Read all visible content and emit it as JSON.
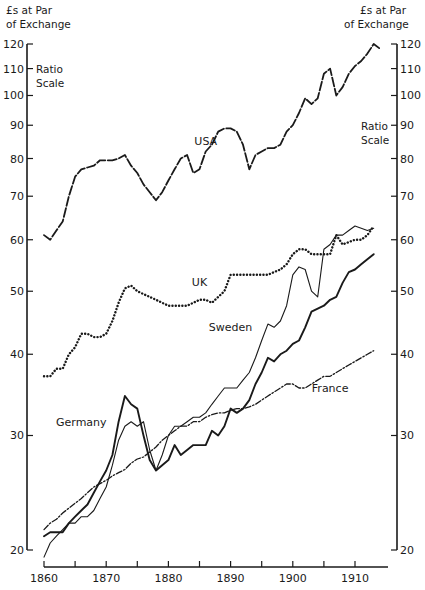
{
  "chart_data": {
    "type": "line",
    "title": "",
    "y_axis_title": [
      "£s at Par",
      "of Exchange"
    ],
    "scale_note": [
      "Ratio",
      "Scale"
    ],
    "xlabel": "",
    "ylabel": "£s at Par of Exchange",
    "y_scale": "log",
    "ylim": [
      20,
      120
    ],
    "xlim": [
      1860,
      1915
    ],
    "grid": false,
    "x_ticks": [
      1860,
      1865,
      1870,
      1875,
      1880,
      1885,
      1890,
      1895,
      1900,
      1905,
      1910
    ],
    "x_tick_labels": [
      "1860",
      "1870",
      "1880",
      "1890",
      "1900",
      "1910"
    ],
    "y_ticks": [
      20,
      30,
      40,
      50,
      60,
      70,
      80,
      90,
      100,
      110,
      120
    ],
    "y_tick_labels": [
      "20",
      "30",
      "40",
      "50",
      "60",
      "70",
      "80",
      "90",
      "100",
      "110",
      "120"
    ],
    "series": [
      {
        "name": "USA",
        "style": "long-dash",
        "label_at": [
          1886,
          84
        ],
        "x": [
          1860,
          1861,
          1862,
          1863,
          1864,
          1865,
          1866,
          1867,
          1868,
          1869,
          1870,
          1871,
          1872,
          1873,
          1874,
          1875,
          1876,
          1877,
          1878,
          1879,
          1880,
          1881,
          1882,
          1883,
          1884,
          1885,
          1886,
          1887,
          1888,
          1889,
          1890,
          1891,
          1892,
          1893,
          1894,
          1895,
          1896,
          1897,
          1898,
          1899,
          1900,
          1901,
          1902,
          1903,
          1904,
          1905,
          1906,
          1907,
          1908,
          1909,
          1910,
          1911,
          1912,
          1913,
          1914
        ],
        "values": [
          61,
          60,
          62,
          64,
          70,
          75,
          77,
          77.5,
          78,
          79.5,
          79.5,
          79.5,
          80,
          81,
          78,
          76,
          73,
          71,
          69,
          71,
          74,
          77,
          80,
          81,
          76,
          77,
          82,
          84,
          88,
          89,
          89,
          88,
          84,
          77,
          81,
          82,
          83,
          83,
          84,
          88,
          90,
          94,
          99,
          97,
          99,
          108,
          110,
          100,
          103,
          108,
          111,
          113,
          116,
          120,
          118
        ]
      },
      {
        "name": "UK",
        "style": "dotted",
        "label_at": [
          1885,
          51
        ],
        "x": [
          1860,
          1861,
          1862,
          1863,
          1864,
          1865,
          1866,
          1867,
          1868,
          1869,
          1870,
          1871,
          1872,
          1873,
          1874,
          1875,
          1876,
          1877,
          1878,
          1879,
          1880,
          1881,
          1882,
          1883,
          1884,
          1885,
          1886,
          1887,
          1888,
          1889,
          1890,
          1891,
          1892,
          1893,
          1894,
          1895,
          1896,
          1897,
          1898,
          1899,
          1900,
          1901,
          1902,
          1903,
          1904,
          1905,
          1906,
          1907,
          1908,
          1909,
          1910,
          1911,
          1912,
          1913
        ],
        "values": [
          37,
          37,
          38,
          38,
          40,
          41,
          43,
          43,
          42.5,
          42.5,
          43,
          45,
          48,
          50.5,
          51,
          50,
          49.5,
          49,
          48.5,
          48,
          47.5,
          47.5,
          47.5,
          47.5,
          48,
          48.5,
          48.5,
          48,
          49,
          50,
          53,
          53,
          53,
          53,
          53,
          53,
          53,
          53.5,
          54,
          55,
          57,
          58,
          58,
          57,
          57,
          57,
          57,
          61,
          59,
          59.5,
          60,
          60,
          61,
          63
        ]
      },
      {
        "name": "Germany",
        "style": "solid-heavy",
        "label_at": [
          1866,
          31
        ],
        "x": [
          1860,
          1861,
          1862,
          1863,
          1864,
          1865,
          1866,
          1867,
          1868,
          1869,
          1870,
          1871,
          1872,
          1873,
          1874,
          1875,
          1876,
          1877,
          1878,
          1879,
          1880,
          1881,
          1882,
          1883,
          1884,
          1885,
          1886,
          1887,
          1888,
          1889,
          1890,
          1891,
          1892,
          1893,
          1894,
          1895,
          1896,
          1897,
          1898,
          1899,
          1900,
          1901,
          1902,
          1903,
          1904,
          1905,
          1906,
          1907,
          1908,
          1909,
          1910,
          1911,
          1912,
          1913
        ],
        "values": [
          21,
          21.3,
          21.3,
          21.3,
          22,
          22.5,
          23,
          23.5,
          24.5,
          25.5,
          26.5,
          28,
          31.5,
          34.5,
          33.5,
          33,
          30,
          27.5,
          26.5,
          27,
          27.5,
          29,
          28,
          28.5,
          29,
          29,
          29,
          30.5,
          30,
          31,
          33,
          32.5,
          33,
          34,
          36,
          37.5,
          39.5,
          39,
          40,
          40.5,
          41.5,
          42,
          44,
          46.5,
          47,
          47.5,
          48.5,
          49,
          51.5,
          53.5,
          54,
          55,
          56,
          57
        ]
      },
      {
        "name": "Sweden",
        "style": "solid-light",
        "label_at": [
          1890,
          43.5
        ],
        "x": [
          1860,
          1861,
          1862,
          1863,
          1864,
          1865,
          1866,
          1867,
          1868,
          1869,
          1870,
          1871,
          1872,
          1873,
          1874,
          1875,
          1876,
          1877,
          1878,
          1879,
          1880,
          1881,
          1882,
          1883,
          1884,
          1885,
          1886,
          1887,
          1888,
          1889,
          1890,
          1891,
          1892,
          1893,
          1894,
          1895,
          1896,
          1897,
          1898,
          1899,
          1900,
          1901,
          1902,
          1903,
          1904,
          1905,
          1906,
          1907,
          1908,
          1909,
          1910,
          1911,
          1912,
          1913
        ],
        "values": [
          19.5,
          20.5,
          21,
          21.5,
          22,
          22,
          22.5,
          22.5,
          23,
          24,
          25,
          27,
          29.5,
          31,
          31.5,
          31,
          31.5,
          28.5,
          26.5,
          28,
          30,
          31,
          31,
          31.5,
          32,
          32,
          32.5,
          33.5,
          34.5,
          35.5,
          35.5,
          35.5,
          36.5,
          37.5,
          39.5,
          42,
          44.5,
          44,
          45,
          47.5,
          53,
          54.5,
          54,
          50,
          49,
          58,
          59,
          61,
          61,
          62,
          63,
          62.5,
          62,
          62.5
        ]
      },
      {
        "name": "France",
        "style": "dash-dot",
        "label_at": [
          1906,
          35
        ],
        "x": [
          1860,
          1861,
          1862,
          1863,
          1864,
          1865,
          1866,
          1867,
          1868,
          1869,
          1870,
          1871,
          1872,
          1873,
          1874,
          1875,
          1876,
          1877,
          1878,
          1879,
          1880,
          1881,
          1882,
          1883,
          1884,
          1885,
          1886,
          1887,
          1888,
          1889,
          1890,
          1891,
          1892,
          1893,
          1894,
          1895,
          1896,
          1897,
          1898,
          1899,
          1900,
          1901,
          1902,
          1903,
          1904,
          1905,
          1906,
          1907,
          1908,
          1909,
          1910,
          1911,
          1912,
          1913
        ],
        "values": [
          21.5,
          22,
          22.3,
          22.8,
          23.2,
          23.6,
          24,
          24.5,
          25,
          25.3,
          25.6,
          26,
          26.3,
          26.6,
          27.2,
          27.6,
          27.8,
          28.3,
          28.8,
          29.5,
          30,
          30.5,
          31,
          31,
          31.5,
          31.5,
          32,
          32.3,
          32.5,
          32.5,
          32.8,
          33,
          33,
          33.2,
          33.5,
          34,
          34.5,
          35,
          35.5,
          36,
          36,
          35.5,
          35.5,
          36,
          36.5,
          37,
          37,
          37.5,
          38,
          38.5,
          39,
          39.5,
          40,
          40.5
        ]
      }
    ]
  }
}
